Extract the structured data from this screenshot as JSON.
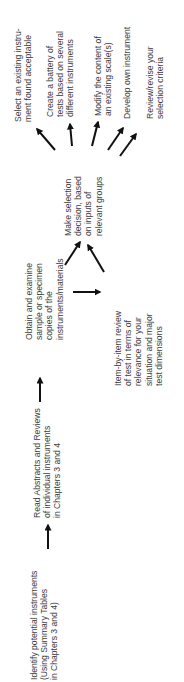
{
  "diagram": {
    "type": "flowchart",
    "orientation": "rotated-90-ccw",
    "colors": {
      "text": "#3c3c3c",
      "arrow": "#111111",
      "background": "#ffffff"
    },
    "nodes": {
      "identify": {
        "lines": [
          "Identify potential instruments",
          "(Using Summary Tables",
          "in Chapters 3 and 4)"
        ]
      },
      "read_abstracts": {
        "lines": [
          "Read Abstracts and Reviews",
          "of individual instruments",
          "in Chapters 3 and 4"
        ]
      },
      "obtain": {
        "lines": [
          "Obtain and examine",
          "sample or specimen",
          "copies of the",
          "instruments/materials"
        ]
      },
      "item_review": {
        "lines": [
          "Item-by-item review",
          "of test in terms of",
          "relevance for your",
          "situation and major",
          "test dimensions"
        ]
      },
      "decision": {
        "lines": [
          "Make selection",
          "decision, based",
          "on inputs of",
          "relevant groups"
        ]
      },
      "outcomes": [
        {
          "id": "select_existing",
          "lines": [
            "Select an existing instru-",
            "ment found acceptable"
          ]
        },
        {
          "id": "create_battery",
          "lines": [
            "Create a battery of",
            "tests based on several",
            "different instruments"
          ]
        },
        {
          "id": "modify_content",
          "lines": [
            "Modify the content of",
            "an existing scale(s)"
          ]
        },
        {
          "id": "develop_own",
          "lines": [
            "Develop own instrument"
          ]
        },
        {
          "id": "review_criteria",
          "lines": [
            "Review/revise your",
            "selection criteria"
          ]
        }
      ]
    },
    "edges": [
      {
        "from": "identify",
        "to": "read_abstracts"
      },
      {
        "from": "read_abstracts",
        "to": "obtain"
      },
      {
        "from": "obtain",
        "to": "item_review"
      },
      {
        "from": "obtain",
        "to": "decision"
      },
      {
        "from": "item_review",
        "to": "decision"
      },
      {
        "from": "decision",
        "to": "select_existing"
      },
      {
        "from": "decision",
        "to": "create_battery"
      },
      {
        "from": "decision",
        "to": "modify_content"
      },
      {
        "from": "decision",
        "to": "develop_own"
      },
      {
        "from": "decision",
        "to": "review_criteria"
      }
    ]
  }
}
